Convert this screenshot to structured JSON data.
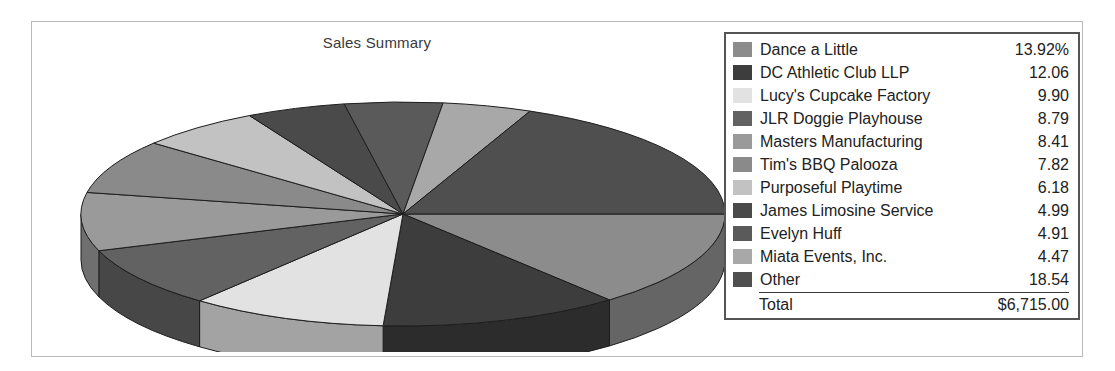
{
  "chart": {
    "title": "Sales Summary"
  },
  "legend": {
    "total_label": "Total",
    "total_value": "$6,715.00"
  },
  "chart_data": {
    "type": "pie",
    "title": "Sales Summary",
    "xlabel": "",
    "ylabel": "",
    "value_unit": "percent",
    "total_label": "Total",
    "total_value": "$6,715.00",
    "total_amount": 6715.0,
    "legend_position": "right",
    "three_d": true,
    "start_angle_deg": 0,
    "direction": "clockwise",
    "labels": [
      "Dance a Little",
      "DC Athletic Club LLP",
      "Lucy's Cupcake Factory",
      "JLR Doggie Playhouse",
      "Masters Manufacturing",
      "Tim's BBQ Palooza",
      "Purposeful Playtime",
      "James Limosine Service",
      "Evelyn Huff",
      "Miata Events, Inc.",
      "Other"
    ],
    "values": [
      13.92,
      12.06,
      9.9,
      8.79,
      8.41,
      7.82,
      6.18,
      4.99,
      4.91,
      4.47,
      18.54
    ],
    "display_values": [
      "13.92%",
      "12.06",
      "9.90",
      "8.79",
      "8.41",
      "7.82",
      "6.18",
      "4.99",
      "4.91",
      "4.47",
      "18.54"
    ],
    "colors": [
      "#8c8c8c",
      "#3d3d3d",
      "#e2e2e2",
      "#626262",
      "#9a9a9a",
      "#8a8a8a",
      "#c2c2c2",
      "#4a4a4a",
      "#5a5a5a",
      "#a8a8a8",
      "#4f4f4f"
    ],
    "slices": [
      {
        "label": "Dance a Little",
        "value": 13.92,
        "display": "13.92%",
        "color": "#8c8c8c"
      },
      {
        "label": "DC Athletic Club LLP",
        "value": 12.06,
        "display": "12.06",
        "color": "#3d3d3d"
      },
      {
        "label": "Lucy's Cupcake Factory",
        "value": 9.9,
        "display": "9.90",
        "color": "#e2e2e2"
      },
      {
        "label": "JLR Doggie Playhouse",
        "value": 8.79,
        "display": "8.79",
        "color": "#626262"
      },
      {
        "label": "Masters Manufacturing",
        "value": 8.41,
        "display": "8.41",
        "color": "#9a9a9a"
      },
      {
        "label": "Tim's BBQ Palooza",
        "value": 7.82,
        "display": "7.82",
        "color": "#8a8a8a"
      },
      {
        "label": "Purposeful Playtime",
        "value": 6.18,
        "display": "6.18",
        "color": "#c2c2c2"
      },
      {
        "label": "James Limosine Service",
        "value": 4.99,
        "display": "4.99",
        "color": "#4a4a4a"
      },
      {
        "label": "Evelyn Huff",
        "value": 4.91,
        "display": "4.91",
        "color": "#5a5a5a"
      },
      {
        "label": "Miata Events, Inc.",
        "value": 4.47,
        "display": "4.47",
        "color": "#a8a8a8"
      },
      {
        "label": "Other",
        "value": 18.54,
        "display": "18.54",
        "color": "#4f4f4f"
      }
    ]
  }
}
